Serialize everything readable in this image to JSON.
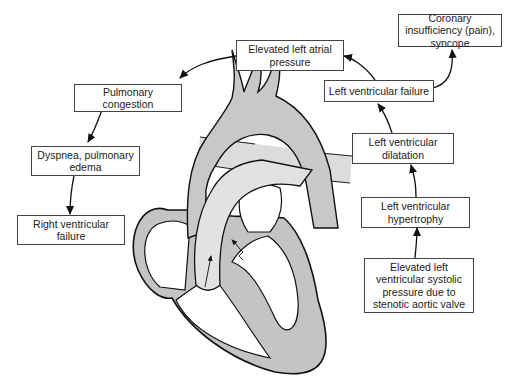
{
  "diagram": {
    "boxes": {
      "left_atrial": "Elevated left atrial pressure",
      "coronary": "Coronary insufficiency (pain), syncope",
      "lv_failure": "Left ventricular failure",
      "pulm_congestion": "Pulmonary congestion",
      "dyspnea": "Dyspnea, pulmonary edema",
      "rv_failure": "Right ventricular failure",
      "lv_dilatation": "Left ventricular dilatation",
      "lv_hypertrophy": "Left ventricular hypertrophy",
      "lv_systolic": "Elevated left ventricular systolic pressure due to stenotic aortic valve"
    },
    "colors": {
      "fill_gray": "#c8c8c8",
      "fill_light": "#e4e4e4",
      "stroke": "#1a1a1a"
    }
  }
}
